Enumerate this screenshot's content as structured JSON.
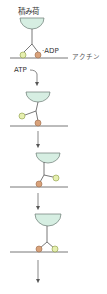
{
  "labels": {
    "cargo": "積み荷",
    "adp": "·ADP",
    "actin": "アクチン",
    "atp": "ATP"
  },
  "colors": {
    "cargo_fill": "#d6eee2",
    "cargo_stroke": "#6a7a72",
    "head_yellow": "#e6efb0",
    "head_yellow_stroke": "#8a9a40",
    "head_orange": "#d9a27a",
    "head_orange_stroke": "#9a6a4a",
    "line": "#555555",
    "arrow": "#555555"
  },
  "stages": [
    {
      "name": "stage-1-adp-bound",
      "cargo_x": 32,
      "cargo_y": 18,
      "line_y": 58
    },
    {
      "name": "stage-2-atp-bound-detached",
      "cargo_x": 38,
      "cargo_y": 92,
      "line_y": 126
    },
    {
      "name": "stage-3-power-stroke",
      "cargo_x": 48,
      "cargo_y": 152,
      "line_y": 187
    },
    {
      "name": "stage-4-step-complete",
      "cargo_x": 48,
      "cargo_y": 214,
      "line_y": 252
    }
  ]
}
